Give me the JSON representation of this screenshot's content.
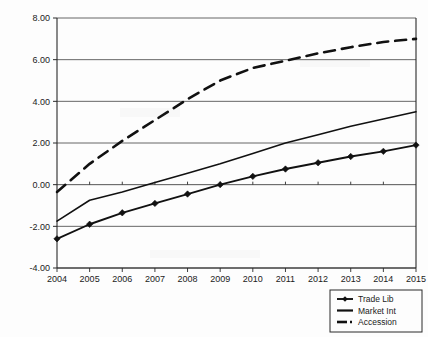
{
  "chart_data": {
    "type": "line",
    "title": "",
    "subtitle": "",
    "xlabel": "",
    "ylabel": "",
    "categories": [
      "2004",
      "2005",
      "2006",
      "2007",
      "2008",
      "2009",
      "2010",
      "2011",
      "2012",
      "2013",
      "2014",
      "2015"
    ],
    "x": [
      2004,
      2005,
      2006,
      2007,
      2008,
      2009,
      2010,
      2011,
      2012,
      2013,
      2014,
      2015
    ],
    "xlim": [
      2004,
      2015
    ],
    "ylim": [
      -4.0,
      8.0
    ],
    "yticks": [
      -4.0,
      -2.0,
      0.0,
      2.0,
      4.0,
      6.0,
      8.0
    ],
    "ytick_labels": [
      "-4.00",
      "-2.00",
      "0.00",
      "2.00",
      "4.00",
      "6.00",
      "8.00"
    ],
    "grid": "horizontal",
    "legend_position": "bottom-right",
    "series": [
      {
        "name": "Trade Lib",
        "style": "solid-with-markers",
        "marker": "diamond",
        "color": "#111111",
        "values": [
          -2.6,
          -1.9,
          -1.35,
          -0.9,
          -0.45,
          0.0,
          0.4,
          0.75,
          1.05,
          1.35,
          1.6,
          1.9
        ]
      },
      {
        "name": "Market Int",
        "style": "solid",
        "marker": "none",
        "color": "#111111",
        "values": [
          -1.75,
          -0.75,
          -0.35,
          0.1,
          0.55,
          1.0,
          1.5,
          2.0,
          2.4,
          2.8,
          3.15,
          3.5
        ]
      },
      {
        "name": "Accession",
        "style": "dashed",
        "marker": "none",
        "color": "#111111",
        "values": [
          -0.35,
          1.0,
          2.1,
          3.1,
          4.1,
          5.0,
          5.6,
          5.95,
          6.3,
          6.6,
          6.85,
          7.0
        ]
      }
    ]
  },
  "legend": {
    "items": [
      {
        "label": "Trade Lib"
      },
      {
        "label": "Market Int"
      },
      {
        "label": "Accession"
      }
    ]
  },
  "axes": {
    "y_tick_labels": [
      "8.00",
      "6.00",
      "4.00",
      "2.00",
      "0.00",
      "-2.00",
      "-4.00"
    ],
    "x_tick_labels": [
      "2004",
      "2005",
      "2006",
      "2007",
      "2008",
      "2009",
      "2010",
      "2011",
      "2012",
      "2013",
      "2014",
      "2015"
    ]
  }
}
